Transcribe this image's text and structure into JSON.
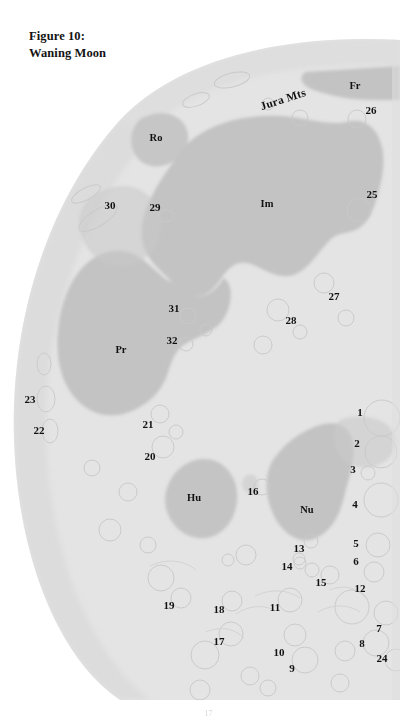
{
  "figure": {
    "caption_line1": "Figure 10:",
    "caption_line2": "Waning Moon",
    "page_number": "17"
  },
  "colors": {
    "page_background": "#ffffff",
    "highland": "#e4e4e4",
    "highland_edge": "#d2d2d2",
    "mare": "#c3c3c3",
    "mare_dark": "#bcbcbc",
    "crater_outline": "#c8c8c8",
    "label_text": "#111111"
  },
  "map": {
    "type": "lunar-phase-diagram",
    "phase": "waning",
    "terminator_side": "right",
    "mare_labels": [
      {
        "id": "fr",
        "text": "Fr",
        "name": "mare-frigoris",
        "x": 355,
        "y": 85
      },
      {
        "id": "ro",
        "text": "Ro",
        "name": "sinus-roris",
        "x": 156,
        "y": 137
      },
      {
        "id": "im",
        "text": "Im",
        "name": "mare-imbrium",
        "x": 267,
        "y": 203
      },
      {
        "id": "pr",
        "text": "Pr",
        "name": "oceanus-procellarum",
        "x": 121,
        "y": 349
      },
      {
        "id": "hu",
        "text": "Hu",
        "name": "mare-humorum",
        "x": 194,
        "y": 497
      },
      {
        "id": "nu",
        "text": "Nu",
        "name": "mare-nubium",
        "x": 307,
        "y": 509
      }
    ],
    "range_labels": [
      {
        "id": "jura",
        "text": "Jura Mts",
        "name": "jura-mountains",
        "x": 283,
        "y": 99,
        "rotation": -18
      }
    ],
    "numbered_features": [
      {
        "n": "1",
        "x": 360,
        "y": 412
      },
      {
        "n": "2",
        "x": 357,
        "y": 443
      },
      {
        "n": "3",
        "x": 353,
        "y": 469
      },
      {
        "n": "4",
        "x": 355,
        "y": 504
      },
      {
        "n": "5",
        "x": 356,
        "y": 543
      },
      {
        "n": "6",
        "x": 356,
        "y": 561
      },
      {
        "n": "7",
        "x": 379,
        "y": 628
      },
      {
        "n": "8",
        "x": 362,
        "y": 643
      },
      {
        "n": "9",
        "x": 292,
        "y": 668
      },
      {
        "n": "10",
        "x": 279,
        "y": 652
      },
      {
        "n": "11",
        "x": 275,
        "y": 607
      },
      {
        "n": "12",
        "x": 360,
        "y": 588
      },
      {
        "n": "13",
        "x": 299,
        "y": 548
      },
      {
        "n": "14",
        "x": 287,
        "y": 566
      },
      {
        "n": "15",
        "x": 321,
        "y": 582
      },
      {
        "n": "16",
        "x": 253,
        "y": 491
      },
      {
        "n": "17",
        "x": 219,
        "y": 641
      },
      {
        "n": "18",
        "x": 219,
        "y": 609
      },
      {
        "n": "19",
        "x": 169,
        "y": 605
      },
      {
        "n": "20",
        "x": 150,
        "y": 456
      },
      {
        "n": "21",
        "x": 148,
        "y": 424
      },
      {
        "n": "22",
        "x": 39,
        "y": 430
      },
      {
        "n": "23",
        "x": 30,
        "y": 399
      },
      {
        "n": "24",
        "x": 382,
        "y": 658
      },
      {
        "n": "25",
        "x": 372,
        "y": 194
      },
      {
        "n": "26",
        "x": 371,
        "y": 110
      },
      {
        "n": "27",
        "x": 334,
        "y": 296
      },
      {
        "n": "28",
        "x": 291,
        "y": 320
      },
      {
        "n": "29",
        "x": 155,
        "y": 207
      },
      {
        "n": "30",
        "x": 110,
        "y": 205
      },
      {
        "n": "31",
        "x": 174,
        "y": 308
      },
      {
        "n": "32",
        "x": 172,
        "y": 340
      }
    ]
  }
}
